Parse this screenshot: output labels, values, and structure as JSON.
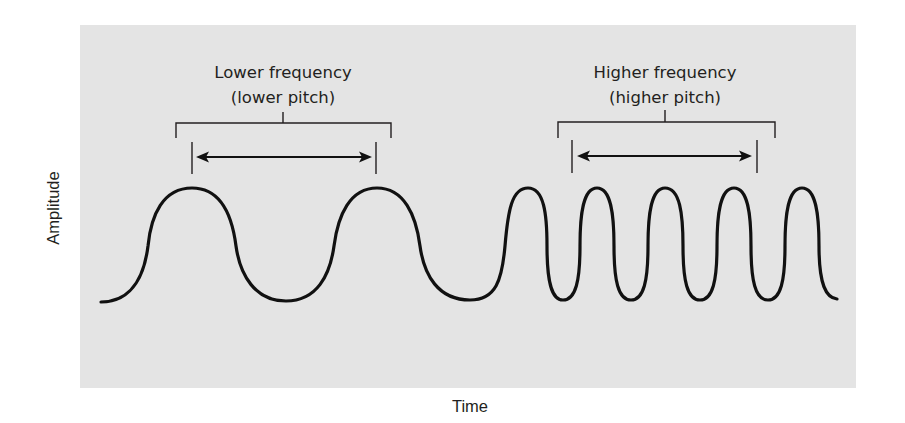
{
  "diagram": {
    "axes": {
      "y_label": "Amplitude",
      "x_label": "Time"
    },
    "annotations": [
      {
        "id": "low",
        "line1": "Lower frequency",
        "line2": "(lower pitch)",
        "description": "One wavelength marked by double-headed arrow between two peaks"
      },
      {
        "id": "high",
        "line1": "Higher frequency",
        "line2": "(higher pitch)",
        "description": "Multiple short wavelengths spanning the same arrow distance"
      }
    ],
    "wave": {
      "low_frequency_peaks": 2,
      "high_frequency_peaks": 5,
      "color": "#111111"
    },
    "colors": {
      "panel_background": "#e4e4e4",
      "page_background": "#ffffff",
      "ink": "#231f20"
    }
  }
}
